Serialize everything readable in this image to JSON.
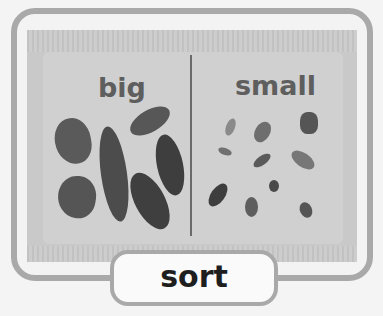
{
  "card": {
    "left_heading": "big",
    "right_heading": "small",
    "word": "sort"
  },
  "illustration": {
    "left_group": "big leaves",
    "left_count": 6,
    "right_group": "small leaves",
    "right_count": 11
  },
  "colors": {
    "frame": "#a9a9a9",
    "panel": "#c9c9c9",
    "heading": "#5e5e5e",
    "word": "#1e1e1e",
    "leaf": "#555555"
  }
}
